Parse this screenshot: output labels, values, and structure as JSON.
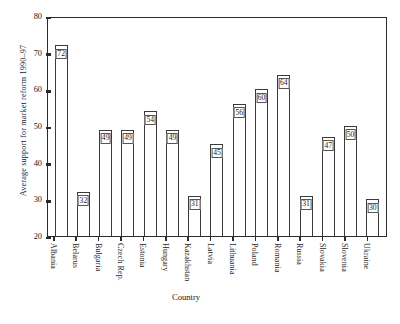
{
  "chart_data": {
    "type": "bar",
    "title": "",
    "xlabel": "Country",
    "ylabel": "Average support for market reform 1990–97",
    "ylim": [
      20,
      80
    ],
    "yticks": [
      20,
      30,
      40,
      50,
      60,
      70,
      80
    ],
    "grid": false,
    "legend": "none",
    "value_labels": true,
    "categories": [
      "Albania",
      "Belarus",
      "Bulgaria",
      "Czech Rep.",
      "Estonia",
      "Hungary",
      "Kazakhstan",
      "Latvia",
      "Lithuania",
      "Poland",
      "Romania",
      "Russia",
      "Slovakia",
      "Slovenia",
      "Ukraine"
    ],
    "values": [
      72,
      32,
      49,
      49,
      54,
      49,
      31,
      45,
      56,
      60,
      64,
      31,
      47,
      50,
      30
    ]
  },
  "colors": {
    "bar_fill": "#ffffff",
    "bar_stroke": "#3a3a3a",
    "axis": "#2c2c2c",
    "text": "#1c1c1c",
    "background": "#ffffff"
  }
}
